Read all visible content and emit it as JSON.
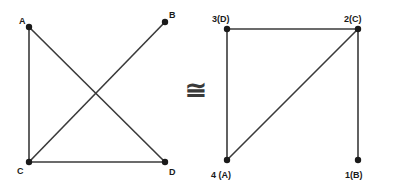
{
  "figure": {
    "background_color": "#ffffff",
    "edge_color": "#3a3a3a",
    "vertex_color": "#1a1a1a",
    "label_color": "#1a1a1a",
    "relation": {
      "symbol": "≅",
      "name": "congruent-isomorphic-to",
      "x": 196,
      "y": 99
    }
  },
  "left_graph": {
    "name": "graph-g",
    "vertices": [
      {
        "id": "A",
        "label": "A",
        "x": 29,
        "y": 27,
        "label_x": 19,
        "label_y": 24
      },
      {
        "id": "B",
        "label": "B",
        "x": 165,
        "y": 22,
        "label_x": 169,
        "label_y": 18
      },
      {
        "id": "C",
        "label": "C",
        "x": 29,
        "y": 162,
        "label_x": 17,
        "label_y": 174
      },
      {
        "id": "D",
        "label": "D",
        "x": 165,
        "y": 162,
        "label_x": 169,
        "label_y": 175
      }
    ],
    "edges": [
      {
        "name": "edge-a-c",
        "from": "A",
        "to": "C",
        "x1": 29,
        "y1": 27,
        "x2": 29,
        "y2": 162
      },
      {
        "name": "edge-a-d",
        "from": "A",
        "to": "D",
        "x1": 29,
        "y1": 27,
        "x2": 165,
        "y2": 162
      },
      {
        "name": "edge-c-b",
        "from": "C",
        "to": "B",
        "x1": 29,
        "y1": 162,
        "x2": 165,
        "y2": 22
      },
      {
        "name": "edge-c-d",
        "from": "C",
        "to": "D",
        "x1": 29,
        "y1": 162,
        "x2": 165,
        "y2": 162
      }
    ]
  },
  "right_graph": {
    "name": "graph-h",
    "vertices": [
      {
        "id": "3D",
        "label": "3(D)",
        "x": 227,
        "y": 29,
        "label_x": 212,
        "label_y": 22
      },
      {
        "id": "2C",
        "label": "2(C)",
        "x": 358,
        "y": 29,
        "label_x": 344,
        "label_y": 22
      },
      {
        "id": "4A",
        "label": "4 (A)",
        "x": 227,
        "y": 160,
        "label_x": 211,
        "label_y": 178
      },
      {
        "id": "1B",
        "label": "1(B)",
        "x": 358,
        "y": 160,
        "label_x": 345,
        "label_y": 178
      }
    ],
    "edges": [
      {
        "name": "edge-3-2",
        "from": "3D",
        "to": "2C",
        "x1": 227,
        "y1": 29,
        "x2": 358,
        "y2": 29
      },
      {
        "name": "edge-3-4",
        "from": "3D",
        "to": "4A",
        "x1": 227,
        "y1": 29,
        "x2": 227,
        "y2": 160
      },
      {
        "name": "edge-4-2",
        "from": "4A",
        "to": "2C",
        "x1": 227,
        "y1": 160,
        "x2": 358,
        "y2": 29
      },
      {
        "name": "edge-2-1",
        "from": "2C",
        "to": "1B",
        "x1": 358,
        "y1": 29,
        "x2": 358,
        "y2": 160
      }
    ]
  }
}
